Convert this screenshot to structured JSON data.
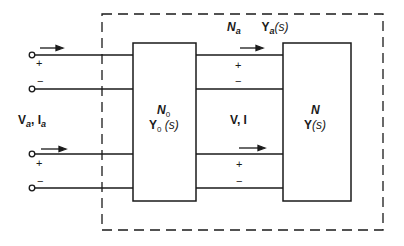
{
  "diagram": {
    "outer_network": {
      "name": "N",
      "name_sub": "a",
      "admittance": "Y",
      "admittance_sub": "a",
      "admittance_arg": "(s)"
    },
    "block_left": {
      "name": "N",
      "name_sub": "0",
      "admittance": "Y",
      "admittance_sub": "0",
      "admittance_arg": " (s)"
    },
    "block_right": {
      "name": "N",
      "admittance": "Y",
      "admittance_arg": "(s)"
    },
    "external_ports_label": {
      "v": "V",
      "v_sub": "a",
      "sep": ", ",
      "i": "I",
      "i_sub": "a"
    },
    "internal_ports_label": "V, I",
    "signs": {
      "plus": "+",
      "minus": "−"
    },
    "colors": {
      "line": "#1a1a1a",
      "background": "#ffffff"
    }
  }
}
